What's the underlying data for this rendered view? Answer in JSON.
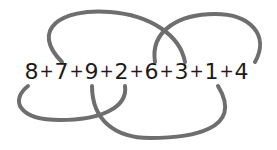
{
  "puzzle": {
    "tokens": [
      "8",
      "+",
      "7",
      "+",
      "9",
      "+",
      "2",
      "+",
      "6",
      "+",
      "3",
      "+",
      "1",
      "+",
      "4"
    ],
    "numbers": [
      8,
      7,
      9,
      2,
      6,
      3,
      1,
      4
    ],
    "operator": "+"
  },
  "colors": {
    "text": "#1b1b1b",
    "curves": "#6e6e6e",
    "background": "#ffffff"
  },
  "curves": [
    {
      "name": "top-left-arc",
      "path": "M62,62 C30,30 60,8 110,12 C150,15 180,35 185,62"
    },
    {
      "name": "top-right-arc",
      "path": "M155,62 C150,30 180,14 215,14 C250,14 270,35 255,62"
    },
    {
      "name": "bottom-left-arc",
      "path": "M28,86 C10,100 18,120 60,120 C100,120 128,108 125,86"
    },
    {
      "name": "bottom-right-arc",
      "path": "M92,86 C92,120 115,138 150,138 C190,138 245,130 218,86"
    }
  ]
}
